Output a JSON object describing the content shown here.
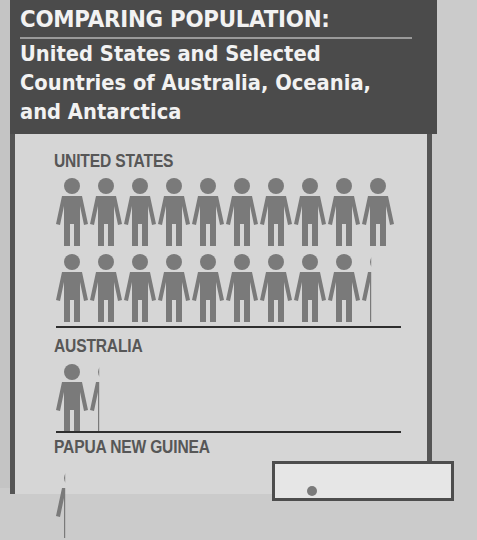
{
  "header": {
    "title": "COMPARING POPULATION:",
    "subtitle_lines": [
      "United States and Selected",
      "Countries of Australia, Oceania,",
      "and Antarctica"
    ]
  },
  "sections": [
    {
      "label": "UNITED STATES",
      "figures": 19.3
    },
    {
      "label": "AUSTRALIA",
      "figures": 1.3
    },
    {
      "label": "PAPUA NEW GUINEA",
      "figures": 0.3
    }
  ],
  "colors": {
    "header_bg": "#4b4b4b",
    "panel_bg": "#d6d6d6",
    "figure": "#7a7a7a",
    "label_text": "#575757"
  },
  "chart_data": {
    "type": "bar",
    "subtype": "pictograph",
    "title": "COMPARING POPULATION: United States and Selected Countries of Australia, Oceania, and Antarctica",
    "categories": [
      "UNITED STATES",
      "AUSTRALIA",
      "PAPUA NEW GUINEA"
    ],
    "values": [
      19.3,
      1.3,
      0.3
    ],
    "unit": "person icons",
    "xlabel": "",
    "ylabel": "",
    "legend": "partially visible box (cut off)",
    "grid": false
  }
}
